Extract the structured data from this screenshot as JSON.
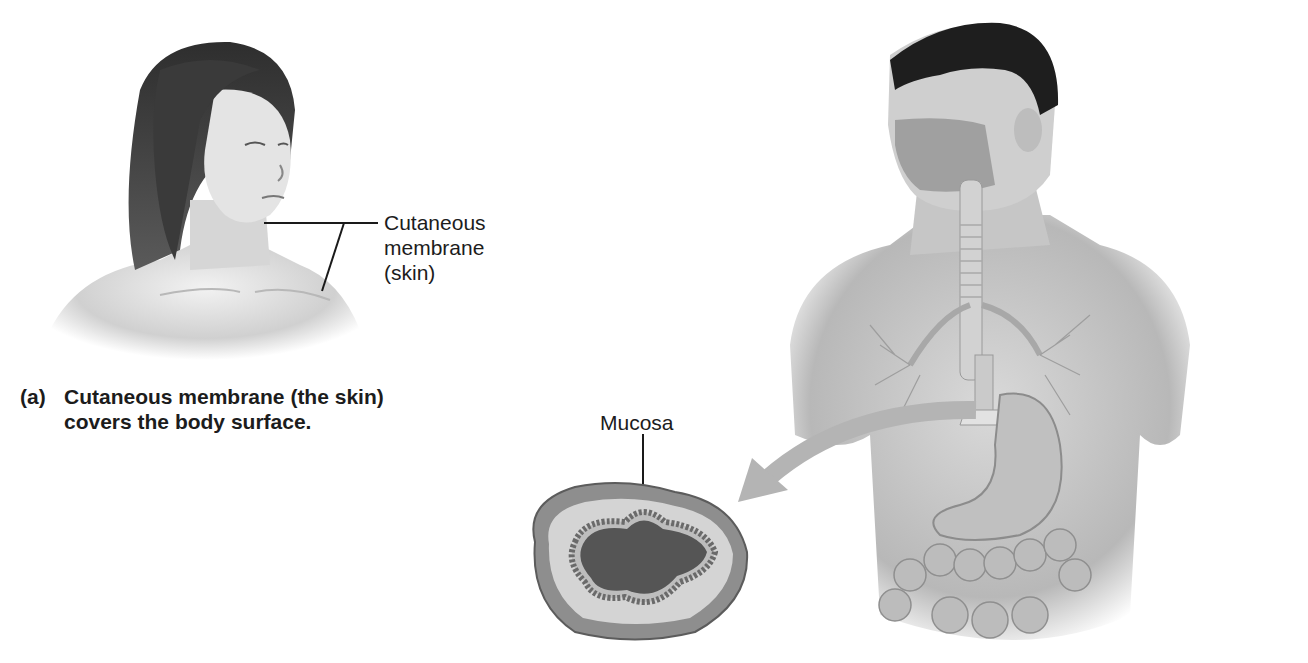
{
  "figure_a": {
    "subject": "woman-head-shoulders",
    "label_lines": [
      "Cutaneous",
      "membrane",
      "(skin)"
    ],
    "caption_tag": "(a)",
    "caption_line1": "Cutaneous membrane (the skin)",
    "caption_line2": "covers the body surface."
  },
  "figure_b": {
    "subject": "man-torso-respiratory-digestive",
    "inset_label": "Mucosa",
    "inset_subject": "cross-section-of-hollow-organ",
    "arrow": "curved-arrow-pointing-to-inset"
  },
  "colors": {
    "background": "#ffffff",
    "text": "#1c1c1c",
    "illustration_light": "#d8d8d8",
    "illustration_mid": "#a8a8a8",
    "illustration_dark": "#3a3a3a",
    "arrow": "#b4b4b4"
  }
}
